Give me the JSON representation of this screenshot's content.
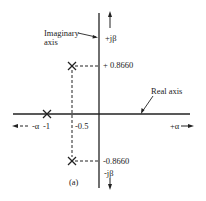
{
  "diagram": {
    "type": "complex-plane-pole-plot",
    "caption": "(a)",
    "colors": {
      "ink": "#222222",
      "background": "#ffffff"
    },
    "axes": {
      "imaginary_label": "Imaginary axis",
      "imaginary_label_line1": "Imaginary",
      "imaginary_label_line2": "axis",
      "real_label": "Real axis",
      "pos_imag": "+jβ",
      "neg_imag": "-jβ",
      "pos_real": "+α",
      "neg_real": "-α"
    },
    "ticks": {
      "real_minus_one": "-1",
      "real_minus_half": "-0.5",
      "imag_pos": "+ 0.8660",
      "imag_neg": "-0.8660"
    },
    "poles": [
      {
        "re": -1,
        "im": 0,
        "marker": "x"
      },
      {
        "re": -0.5,
        "im": 0.866,
        "marker": "x"
      },
      {
        "re": -0.5,
        "im": -0.866,
        "marker": "x"
      }
    ]
  }
}
